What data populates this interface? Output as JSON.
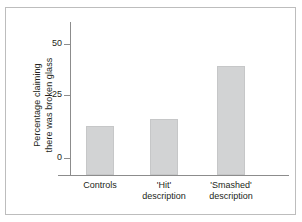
{
  "figure": {
    "border_color": "#bdbdbd",
    "background": "#ffffff",
    "axis_color": "#8c8c8c",
    "bar_color": "#d2d3d4",
    "text_color": "#231f20"
  },
  "chart_data": {
    "type": "bar",
    "title": "",
    "subtitle": "",
    "xlabel": "",
    "ylabel_line1": "Percentage claiming",
    "ylabel_line2": "there was broken glass",
    "categories": [
      "Controls",
      "'Hit'\ndescription",
      "'Smashed'\ndescription"
    ],
    "category_labels": [
      {
        "line1": "Controls",
        "line2": ""
      },
      {
        "line1": "'Hit'",
        "line2": "description"
      },
      {
        "line1": "'Smashed'",
        "line2": "description"
      }
    ],
    "values": [
      14,
      17,
      40
    ],
    "ylim": [
      0,
      57
    ],
    "yticks": [
      0,
      25,
      50
    ],
    "ytick_labels": [
      "0",
      "25",
      "50"
    ],
    "grid": false,
    "legend": false
  }
}
